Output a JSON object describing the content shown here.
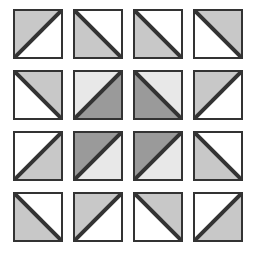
{
  "figure": {
    "rows": 4,
    "columns": 4,
    "tile_count": 16
  },
  "colors": {
    "background": "#ffffff",
    "border": "#333333",
    "white": "#ffffff",
    "light_gray": "#e8e8e8",
    "gray": "#c8c8c8",
    "dark_gray": "#9a9a9a"
  },
  "geometry": {
    "canvas_width": 263,
    "canvas_height": 257,
    "tile_size": 50,
    "origin_x": 13,
    "origin_y": 9,
    "step_x": 60,
    "step_y": 61,
    "border_width": 2
  },
  "legend": {
    "diagonal_types": [
      "tlbr",
      "bltr"
    ],
    "tlbr_label": "diagonal from top-left to bottom-right",
    "bltr_label": "diagonal from bottom-left to top-right",
    "fill_names": [
      "white",
      "light_gray",
      "gray",
      "dark_gray"
    ]
  },
  "tiles": [
    {
      "id": "r1c1",
      "row": 1,
      "col": 1,
      "diagonal": "bltr",
      "upper_fill": "gray",
      "lower_fill": "white",
      "upper_color": "#c8c8c8",
      "lower_color": "#ffffff"
    },
    {
      "id": "r1c2",
      "row": 1,
      "col": 2,
      "diagonal": "tlbr",
      "upper_fill": "white",
      "lower_fill": "gray",
      "upper_color": "#ffffff",
      "lower_color": "#c8c8c8"
    },
    {
      "id": "r1c3",
      "row": 1,
      "col": 3,
      "diagonal": "tlbr",
      "upper_fill": "white",
      "lower_fill": "gray",
      "upper_color": "#ffffff",
      "lower_color": "#c8c8c8"
    },
    {
      "id": "r1c4",
      "row": 1,
      "col": 4,
      "diagonal": "tlbr",
      "upper_fill": "gray",
      "lower_fill": "white",
      "upper_color": "#c8c8c8",
      "lower_color": "#ffffff"
    },
    {
      "id": "r2c1",
      "row": 2,
      "col": 1,
      "diagonal": "tlbr",
      "upper_fill": "gray",
      "lower_fill": "white",
      "upper_color": "#c8c8c8",
      "lower_color": "#ffffff"
    },
    {
      "id": "r2c2",
      "row": 2,
      "col": 2,
      "diagonal": "bltr",
      "upper_fill": "light_gray",
      "lower_fill": "dark_gray",
      "upper_color": "#e8e8e8",
      "lower_color": "#9a9a9a"
    },
    {
      "id": "r2c3",
      "row": 2,
      "col": 3,
      "diagonal": "tlbr",
      "upper_fill": "light_gray",
      "lower_fill": "dark_gray",
      "upper_color": "#e8e8e8",
      "lower_color": "#9a9a9a"
    },
    {
      "id": "r2c4",
      "row": 2,
      "col": 4,
      "diagonal": "bltr",
      "upper_fill": "gray",
      "lower_fill": "white",
      "upper_color": "#c8c8c8",
      "lower_color": "#ffffff"
    },
    {
      "id": "r3c1",
      "row": 3,
      "col": 1,
      "diagonal": "bltr",
      "upper_fill": "white",
      "lower_fill": "gray",
      "upper_color": "#ffffff",
      "lower_color": "#c8c8c8"
    },
    {
      "id": "r3c2",
      "row": 3,
      "col": 2,
      "diagonal": "bltr",
      "upper_fill": "dark_gray",
      "lower_fill": "light_gray",
      "upper_color": "#9a9a9a",
      "lower_color": "#e8e8e8"
    },
    {
      "id": "r3c3",
      "row": 3,
      "col": 3,
      "diagonal": "bltr",
      "upper_fill": "dark_gray",
      "lower_fill": "light_gray",
      "upper_color": "#9a9a9a",
      "lower_color": "#e8e8e8"
    },
    {
      "id": "r3c4",
      "row": 3,
      "col": 4,
      "diagonal": "tlbr",
      "upper_fill": "white",
      "lower_fill": "gray",
      "upper_color": "#ffffff",
      "lower_color": "#c8c8c8"
    },
    {
      "id": "r4c1",
      "row": 4,
      "col": 1,
      "diagonal": "tlbr",
      "upper_fill": "white",
      "lower_fill": "gray",
      "upper_color": "#ffffff",
      "lower_color": "#c8c8c8"
    },
    {
      "id": "r4c2",
      "row": 4,
      "col": 2,
      "diagonal": "bltr",
      "upper_fill": "gray",
      "lower_fill": "white",
      "upper_color": "#c8c8c8",
      "lower_color": "#ffffff"
    },
    {
      "id": "r4c3",
      "row": 4,
      "col": 3,
      "diagonal": "tlbr",
      "upper_fill": "gray",
      "lower_fill": "white",
      "upper_color": "#c8c8c8",
      "lower_color": "#ffffff"
    },
    {
      "id": "r4c4",
      "row": 4,
      "col": 4,
      "diagonal": "bltr",
      "upper_fill": "white",
      "lower_fill": "gray",
      "upper_color": "#ffffff",
      "lower_color": "#c8c8c8"
    }
  ]
}
